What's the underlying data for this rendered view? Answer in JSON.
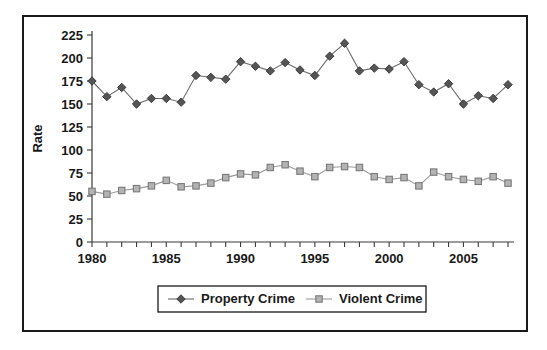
{
  "chart_data": {
    "type": "line",
    "title": "",
    "xlabel": "",
    "ylabel": "Rate",
    "ylim": [
      0,
      225
    ],
    "ytick_step": 25,
    "yticks": [
      "0",
      "25",
      "50",
      "75",
      "100",
      "125",
      "150",
      "175",
      "200",
      "225"
    ],
    "xlim": [
      1980,
      2008
    ],
    "xticks_labeled": [
      "1980",
      "1985",
      "1990",
      "1995",
      "2000",
      "2005"
    ],
    "xtick_step_minor": 1,
    "grid": false,
    "legend_position": "bottom-center",
    "x": [
      1980,
      1981,
      1982,
      1983,
      1984,
      1985,
      1986,
      1987,
      1988,
      1989,
      1990,
      1991,
      1992,
      1993,
      1994,
      1995,
      1996,
      1997,
      1998,
      1999,
      2000,
      2001,
      2002,
      2003,
      2004,
      2005,
      2006,
      2007,
      2008
    ],
    "series": [
      {
        "name": "Property Crime",
        "color": "#555555",
        "marker": "diamond",
        "values": [
          175,
          158,
          168,
          150,
          156,
          156,
          152,
          181,
          179,
          177,
          196,
          191,
          186,
          195,
          187,
          181,
          202,
          216,
          186,
          189,
          188,
          196,
          171,
          163,
          172,
          150,
          159,
          156,
          171
        ]
      },
      {
        "name": "Violent Crime",
        "color": "#b3b3b3",
        "marker": "square",
        "values": [
          55,
          52,
          56,
          58,
          61,
          67,
          60,
          61,
          64,
          70,
          74,
          73,
          81,
          84,
          77,
          71,
          81,
          82,
          81,
          71,
          68,
          70,
          61,
          76,
          71,
          68,
          66,
          71,
          64
        ]
      }
    ]
  },
  "legend": {
    "items": [
      {
        "label": "Property Crime",
        "marker": "diamond-marker",
        "color": "#555555"
      },
      {
        "label": "Violent Crime",
        "marker": "square-marker",
        "color": "#b3b3b3"
      }
    ]
  },
  "axes": {
    "y_title": "Rate"
  }
}
